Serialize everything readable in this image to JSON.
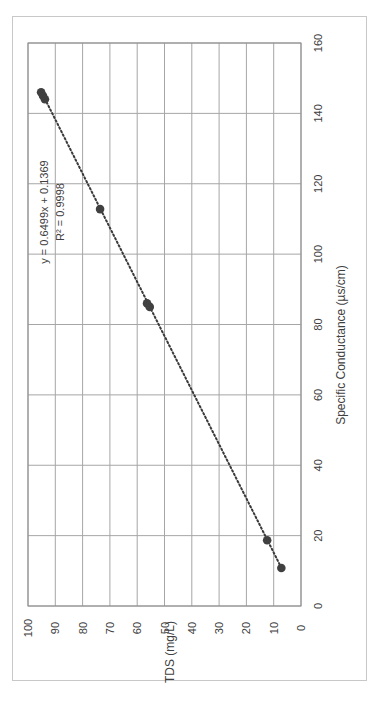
{
  "chart_data": {
    "type": "scatter",
    "orientation": "rotated-90-ccw",
    "title": "",
    "xlabel": "Specific Conductance (µs/cm)",
    "ylabel": "TDS (mg/L)",
    "xlim": [
      0,
      160
    ],
    "ylim": [
      0,
      100
    ],
    "xticks": [
      0,
      20,
      40,
      60,
      80,
      100,
      120,
      140,
      160
    ],
    "yticks": [
      0,
      10,
      20,
      30,
      40,
      50,
      60,
      70,
      80,
      90,
      100
    ],
    "grid": true,
    "legend": "none",
    "series": [
      {
        "name": "Samples",
        "color": "#404040",
        "x": [
          10.8,
          18.7,
          85.0,
          86.0,
          112.8,
          144.0,
          145.0,
          146.0
        ],
        "y": [
          7.2,
          12.4,
          55.4,
          56.4,
          73.6,
          93.8,
          94.5,
          95.2
        ]
      }
    ],
    "trendline": {
      "type": "linear",
      "slope": 0.6499,
      "intercept": 0.1369,
      "r2": 0.9998,
      "x_range": [
        10.8,
        146.0
      ],
      "style": "dotted",
      "color": "#3a3a3a"
    },
    "annotations": [
      {
        "text": "y = 0.6499x + 0.1369",
        "x": 112,
        "y": 90
      },
      {
        "text": "R² = 0.9998",
        "x": 112,
        "y": 87
      }
    ]
  },
  "labels": {
    "equation": "y = 0.6499x + 0.1369",
    "r_squared": "R² = 0.9998",
    "x_axis_title": "Specific Conductance (µs/cm)",
    "y_axis_title": "TDS (mg/L)"
  }
}
